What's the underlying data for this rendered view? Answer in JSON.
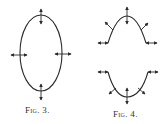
{
  "figures": [
    {
      "id": "fig3",
      "label": "Fig. 3.",
      "shape": "closed ellipse with four double-headed arrows (top, bottom, left, right)"
    },
    {
      "id": "fig4",
      "label": "Fig. 4.",
      "shape": "upper arch and lower cup curves with double-headed arrows at ends, middle and sides"
    }
  ],
  "colors": {
    "stroke": "#2a2a2a",
    "background": "#ffffff"
  }
}
